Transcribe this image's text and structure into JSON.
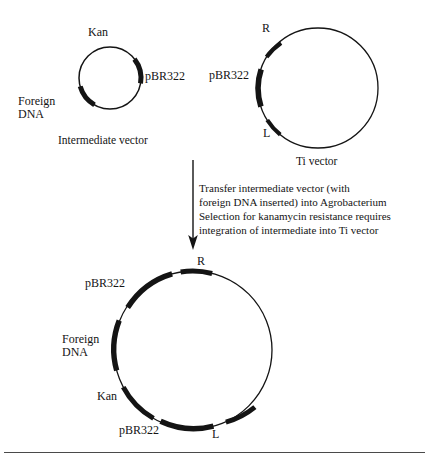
{
  "figure": {
    "title_text": "",
    "colors": {
      "stroke": "#141414",
      "arc_fill": "#141414",
      "background": "#ffffff",
      "rule": "#4a4a4a"
    },
    "intermediate_vector": {
      "caption": "Intermediate vector",
      "center": {
        "x": 110,
        "y": 78
      },
      "radius": 31,
      "labels": {
        "kan": "Kan",
        "pbr322": "pBR322",
        "foreign_dna_line1": "Foreign",
        "foreign_dna_line2": "DNA"
      },
      "segments": [
        {
          "name": "pbr322-arc",
          "start_deg": -38,
          "end_deg": 10
        },
        {
          "name": "foreign-dna-arc",
          "start_deg": 120,
          "end_deg": 196
        }
      ]
    },
    "ti_vector": {
      "caption": "Ti vector",
      "center": {
        "x": 318,
        "y": 88
      },
      "radius": 60,
      "labels": {
        "r": "R",
        "pbr322": "pBR322",
        "l": "L"
      },
      "segments": [
        {
          "name": "r-border-arc",
          "start_deg": 211,
          "end_deg": 232
        },
        {
          "name": "pbr322-arc",
          "start_deg": 162,
          "end_deg": 198
        },
        {
          "name": "l-border-arc",
          "start_deg": 129,
          "end_deg": 150
        }
      ]
    },
    "transfer_step": {
      "arrow": {
        "x": 193,
        "y_start": 160,
        "y_end": 248
      },
      "text": "Transfer intermediate vector (with\nforeign DNA inserted) into Agrobacterium\nSelection for kanamycin resistance requires\nintegration of intermediate into Ti vector"
    },
    "integrated_vector": {
      "center": {
        "x": 193,
        "y": 350
      },
      "radius": 79,
      "labels": {
        "r": "R",
        "pbr322_top": "pBR322",
        "foreign_dna_line1": "Foreign",
        "foreign_dna_line2": "DNA",
        "kan": "Kan",
        "pbr322_bottom": "pBR322",
        "l": "L"
      },
      "segments": [
        {
          "name": "r-border-arc",
          "start_deg": -99,
          "end_deg": -76
        },
        {
          "name": "pbr322-top-arc",
          "start_deg": -67,
          "end_deg": -125
        },
        {
          "name": "foreign-dna-arc",
          "start_deg": 165,
          "end_deg": 202
        },
        {
          "name": "kan-arc",
          "start_deg": 120,
          "end_deg": 152
        },
        {
          "name": "pbr322-bottom-arc",
          "start_deg": 75,
          "end_deg": 107
        },
        {
          "name": "l-border-arc",
          "start_deg": 46,
          "end_deg": 66
        }
      ]
    },
    "footer_rule": {
      "x": 4,
      "y": 452,
      "width": 421,
      "height": 1
    }
  }
}
